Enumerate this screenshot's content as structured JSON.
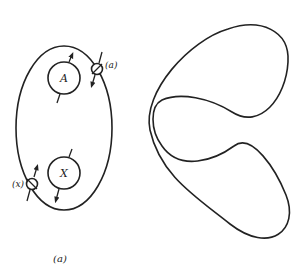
{
  "figure_a": {
    "caption": "(a)",
    "nodes": {
      "A": {
        "label": "A"
      },
      "X": {
        "label": "X"
      }
    },
    "junctions": {
      "a": {
        "label": "(a)"
      },
      "x": {
        "label": "(x)"
      }
    }
  },
  "figure_b": {
    "caption": "(b)",
    "nodes": {
      "A": {
        "label": "A"
      },
      "C": {
        "label": "C"
      },
      "B": {
        "label": "B"
      }
    },
    "junctions": {
      "a": {
        "label": "(a)"
      },
      "c2": {
        "label": "(c",
        "sub": "2",
        "close": ")"
      },
      "c1": {
        "label": "(c",
        "sub": "1",
        "close": ")"
      },
      "b": {
        "label": "(b)"
      }
    }
  }
}
